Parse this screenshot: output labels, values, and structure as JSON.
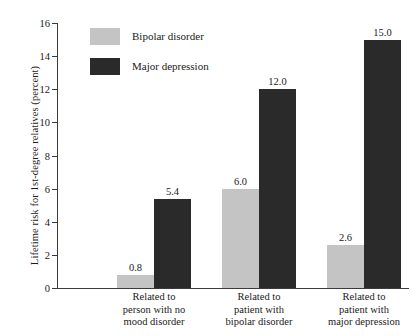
{
  "chart_data": {
    "type": "bar",
    "title": "",
    "xlabel": "",
    "ylabel": "Lifetime risk for 1st-degree relatives (percent)",
    "ylim": [
      0,
      16
    ],
    "yticks": [
      0,
      2,
      4,
      6,
      8,
      10,
      12,
      14,
      16
    ],
    "ytick_labels": [
      "0",
      "2",
      "4",
      "6",
      "8",
      "10",
      "12",
      "14",
      "16"
    ],
    "grid": false,
    "legend_position": "top-left-inside",
    "categories": [
      "Related to person with no mood disorder",
      "Related to patient with bipolar disorder",
      "Related to patient with major depression"
    ],
    "category_lines": [
      [
        "Related to",
        "person with no",
        "mood disorder"
      ],
      [
        "Related to",
        "patient with",
        "bipolar disorder"
      ],
      [
        "Related to",
        "patient with",
        "major depression"
      ]
    ],
    "series": [
      {
        "name": "Bipolar disorder",
        "color": "#c4c4c4",
        "values": [
          0.8,
          6.0,
          2.6
        ],
        "labels": [
          "0.8",
          "6.0",
          "2.6"
        ]
      },
      {
        "name": "Major depression",
        "color": "#2a2a2a",
        "values": [
          5.4,
          12.0,
          15.0
        ],
        "labels": [
          "5.4",
          "12.0",
          "15.0"
        ]
      }
    ]
  },
  "legend": {
    "items": [
      {
        "label": "Bipolar disorder",
        "color": "#c4c4c4"
      },
      {
        "label": "Major depression",
        "color": "#2a2a2a"
      }
    ]
  },
  "axis": {
    "color": "#3a3a3a"
  }
}
